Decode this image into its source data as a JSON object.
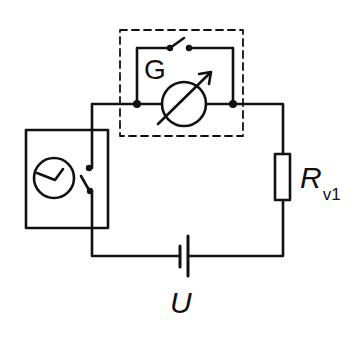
{
  "diagram": {
    "type": "electrical circuit schematic",
    "stroke_color": "#111111",
    "background": "#ffffff",
    "components": [
      {
        "id": "galvanometer",
        "label": "G",
        "symbol": "meter with diagonal arrow",
        "enclosure": "dashed box"
      },
      {
        "id": "shunt-switch",
        "symbol": "open switch in parallel with galvanometer"
      },
      {
        "id": "timer-switch",
        "symbol": "clock with switch contact in solid box"
      },
      {
        "id": "series-resistor",
        "label": "R",
        "subscript": "v1"
      },
      {
        "id": "battery",
        "label": "U",
        "symbol": "DC voltage source"
      }
    ],
    "labels": {
      "galvanometer": "G",
      "resistor_main": "R",
      "resistor_sub": "v1",
      "source": "U"
    }
  }
}
